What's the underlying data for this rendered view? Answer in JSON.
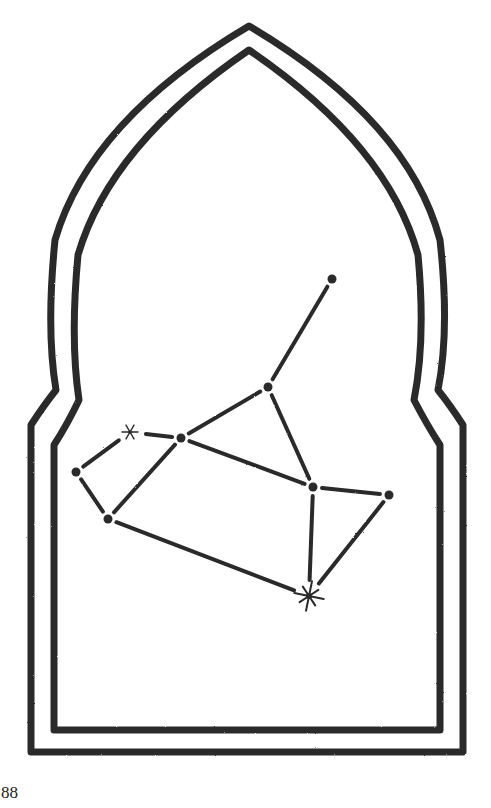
{
  "page": {
    "page_number": "88"
  },
  "illustration": {
    "subject": "constellation-in-arched-window-frame",
    "colors": {
      "ink": "#2a2a2a",
      "paper": "#ffffff"
    },
    "frame": {
      "outer_path": "M 31 752 L 31 425 Q 44 405 56 390 Q 46 330 55 240 Q 90 120 249 26 Q 408 120 440 240 Q 450 330 438 390 Q 450 405 463 425 L 463 752 Z",
      "inner_path": "M 54 730 L 54 445 Q 67 425 79 400 Q 70 340 78 255 Q 110 145 249 50 Q 388 145 418 255 Q 426 340 414 400 Q 427 425 440 445 L 440 730 Z"
    },
    "stars": [
      {
        "id": "s1",
        "x": 332,
        "y": 279,
        "type": "dot"
      },
      {
        "id": "s2",
        "x": 268,
        "y": 387,
        "type": "dot"
      },
      {
        "id": "s3",
        "x": 181,
        "y": 438,
        "type": "dot"
      },
      {
        "id": "s4",
        "x": 130,
        "y": 432,
        "type": "sparkle-small"
      },
      {
        "id": "s5",
        "x": 76,
        "y": 472,
        "type": "dot"
      },
      {
        "id": "s6",
        "x": 108,
        "y": 519,
        "type": "dot"
      },
      {
        "id": "s7",
        "x": 313,
        "y": 487,
        "type": "dot"
      },
      {
        "id": "s8",
        "x": 389,
        "y": 495,
        "type": "dot"
      },
      {
        "id": "s9",
        "x": 309,
        "y": 596,
        "type": "sparkle-large"
      }
    ],
    "lines": [
      {
        "from": "s1",
        "to": "s2"
      },
      {
        "from": "s2",
        "to": "s3"
      },
      {
        "from": "s2",
        "to": "s7"
      },
      {
        "from": "s3",
        "to": "s4"
      },
      {
        "from": "s3",
        "to": "s7"
      },
      {
        "from": "s3",
        "to": "s6"
      },
      {
        "from": "s4",
        "to": "s5"
      },
      {
        "from": "s5",
        "to": "s6"
      },
      {
        "from": "s6",
        "to": "s9"
      },
      {
        "from": "s7",
        "to": "s8"
      },
      {
        "from": "s7",
        "to": "s9"
      },
      {
        "from": "s8",
        "to": "s9"
      }
    ]
  }
}
